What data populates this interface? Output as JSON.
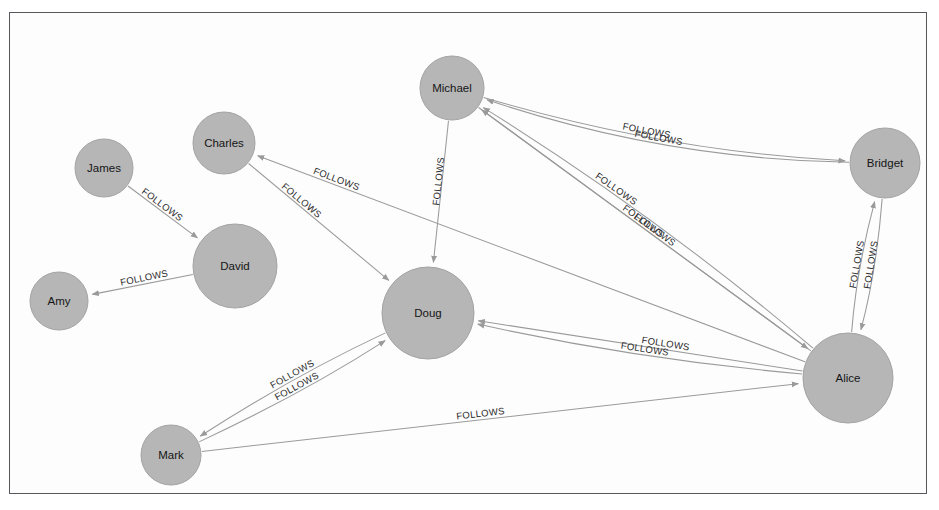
{
  "canvas": {
    "width": 939,
    "height": 510,
    "background": "#ffffff",
    "frame": {
      "x": 9,
      "y": 12,
      "width": 918,
      "height": 482,
      "border_color": "#58585c"
    }
  },
  "style": {
    "node_fill": "#b6b6b6",
    "node_stroke": "#a3a3a3",
    "edge_color": "#9a9a9a",
    "node_label_color": "#151515",
    "edge_label_color": "#2b2b2b"
  },
  "graph": {
    "type": "directed-node-link",
    "relationship_type": "FOLLOWS",
    "node_count": 9,
    "edge_count": 16,
    "nodes": [
      {
        "id": "amy",
        "label": "Amy",
        "x": 59,
        "y": 301,
        "r": 29
      },
      {
        "id": "james",
        "label": "James",
        "x": 104,
        "y": 168,
        "r": 29
      },
      {
        "id": "charles",
        "label": "Charles",
        "x": 224,
        "y": 143,
        "r": 31
      },
      {
        "id": "david",
        "label": "David",
        "x": 235,
        "y": 266,
        "r": 42
      },
      {
        "id": "mark",
        "label": "Mark",
        "x": 171,
        "y": 455,
        "r": 30
      },
      {
        "id": "doug",
        "label": "Doug",
        "x": 428,
        "y": 313,
        "r": 46
      },
      {
        "id": "michael",
        "label": "Michael",
        "x": 452,
        "y": 88,
        "r": 32
      },
      {
        "id": "bridget",
        "label": "Bridget",
        "x": 885,
        "y": 163,
        "r": 35
      },
      {
        "id": "alice",
        "label": "Alice",
        "x": 848,
        "y": 378,
        "r": 45
      }
    ],
    "edges": [
      {
        "id": "e1",
        "source": "james",
        "target": "david",
        "label": "FOLLOWS",
        "curve": 0,
        "label_t": 0.42
      },
      {
        "id": "e2",
        "source": "david",
        "target": "amy",
        "label": "FOLLOWS",
        "curve": 0,
        "label_t": 0.5
      },
      {
        "id": "e3",
        "source": "alice",
        "target": "charles",
        "label": "FOLLOWS",
        "curve": 0,
        "label_t": 0.86
      },
      {
        "id": "e4",
        "source": "charles",
        "target": "doug",
        "label": "FOLLOWS",
        "curve": 0,
        "label_t": 0.34
      },
      {
        "id": "e5",
        "source": "michael",
        "target": "doug",
        "label": "FOLLOWS",
        "curve": 0,
        "label_t": 0.42
      },
      {
        "id": "e6",
        "source": "bridget",
        "target": "michael",
        "label": "FOLLOWS",
        "curve": -34,
        "label_t": 0.52
      },
      {
        "id": "e7",
        "source": "michael",
        "target": "bridget",
        "label": "FOLLOWS",
        "curve": 26,
        "label_t": 0.45
      },
      {
        "id": "e8",
        "source": "alice",
        "target": "michael",
        "label": "FOLLOWS",
        "curve": 0,
        "label_t": 0.52
      },
      {
        "id": "e9",
        "source": "alice",
        "target": "michael",
        "label": "FOLLOWS",
        "curve": 18,
        "label_t": 0.62
      },
      {
        "id": "e10",
        "source": "michael",
        "target": "alice",
        "label": "FOLLOWS",
        "curve": 0,
        "label_t": 0.52
      },
      {
        "id": "e11",
        "source": "alice",
        "target": "doug",
        "label": "FOLLOWS",
        "curve": 0,
        "label_t": 0.42
      },
      {
        "id": "e12",
        "source": "alice",
        "target": "doug",
        "label": "FOLLOWS",
        "curve": -14,
        "label_t": 0.48
      },
      {
        "id": "e13",
        "source": "bridget",
        "target": "alice",
        "label": "FOLLOWS",
        "curve": -10,
        "label_t": 0.5
      },
      {
        "id": "e14",
        "source": "alice",
        "target": "bridget",
        "label": "FOLLOWS",
        "curve": -10,
        "label_t": 0.5
      },
      {
        "id": "e15",
        "source": "doug",
        "target": "mark",
        "label": "FOLLOWS",
        "curve": 10,
        "label_t": 0.5
      },
      {
        "id": "e16",
        "source": "mark",
        "target": "doug",
        "label": "FOLLOWS",
        "curve": 10,
        "label_t": 0.5
      },
      {
        "id": "e17",
        "source": "mark",
        "target": "alice",
        "label": "FOLLOWS",
        "curve": 0,
        "label_t": 0.46
      }
    ]
  }
}
